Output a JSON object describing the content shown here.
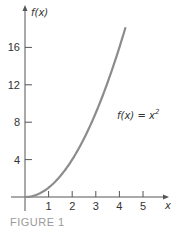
{
  "chart_data": {
    "type": "line",
    "title": "",
    "xlabel": "x",
    "ylabel": "f(x)",
    "xlim": [
      0,
      5.8
    ],
    "ylim": [
      0,
      19
    ],
    "x_ticks": [
      1,
      2,
      3,
      4,
      5
    ],
    "y_ticks": [
      4,
      8,
      12,
      16
    ],
    "x_tick_labels": [
      "1",
      "2",
      "3",
      "4",
      "5"
    ],
    "y_tick_labels": [
      "4",
      "8",
      "12",
      "16"
    ],
    "grid": false,
    "series": [
      {
        "name": "f(x) = x^2",
        "function": "x^2",
        "x_range": [
          0,
          4.25
        ],
        "x": [
          0,
          0.5,
          1,
          1.5,
          2,
          2.5,
          3,
          3.5,
          4,
          4.25
        ],
        "y": [
          0,
          0.25,
          1,
          2.25,
          4,
          6.25,
          9,
          12.25,
          16,
          18.06
        ],
        "color": "#8c8c8c"
      }
    ],
    "annotations": [
      {
        "text": "f(x) = x",
        "superscript": "2",
        "at": [
          3.9,
          8.3
        ]
      }
    ],
    "caption": "FIGURE 1"
  },
  "colors": {
    "axis": "#555555",
    "curve": "#8c8c8c",
    "caption": "#9a9a9a"
  }
}
